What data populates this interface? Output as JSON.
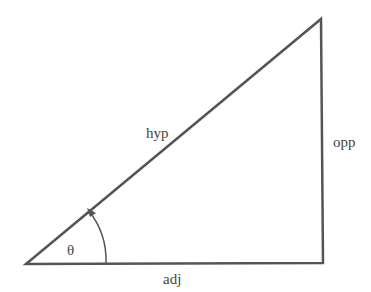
{
  "diagram": {
    "type": "right-triangle",
    "labels": {
      "hypotenuse": "hyp",
      "opposite": "opp",
      "adjacent": "adj",
      "angle": "θ"
    },
    "colors": {
      "stroke": "#555555",
      "text": "#444444",
      "background": "#ffffff"
    }
  }
}
